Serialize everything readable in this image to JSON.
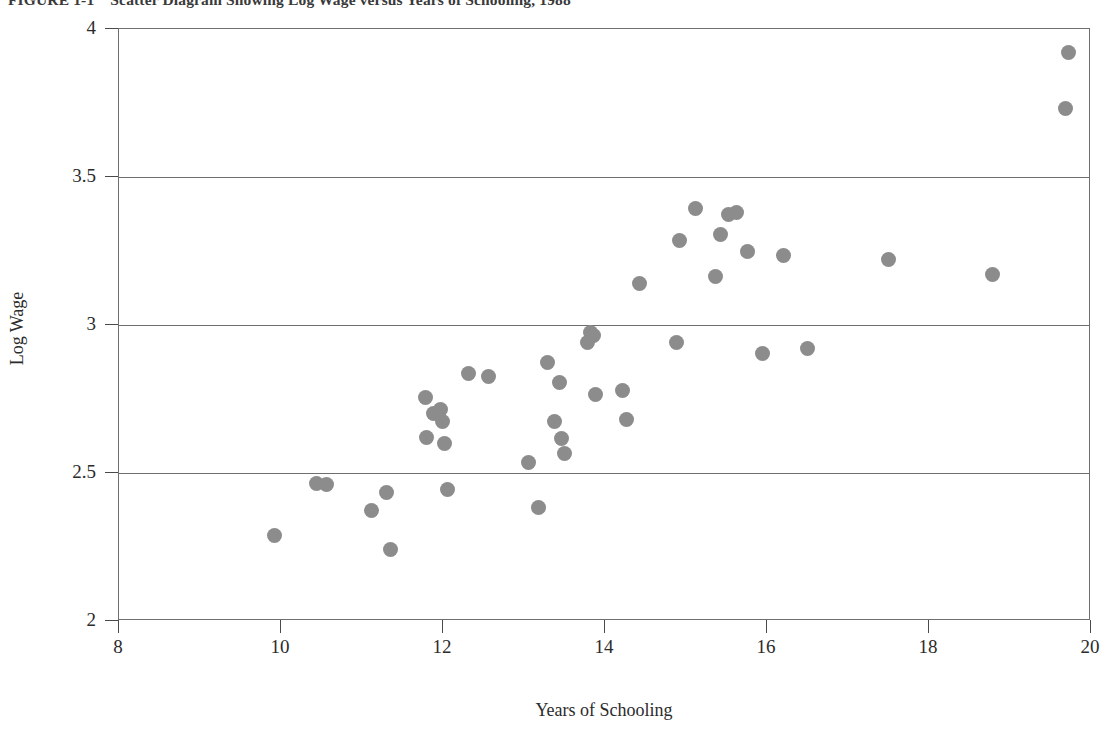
{
  "figure": {
    "caption_number": "FIGURE 1-1",
    "caption_text": "Scatter Diagram Showing Log Wage versus Years of Schooling, 1988"
  },
  "chart_data": {
    "type": "scatter",
    "title": "Scatter Diagram Showing Log Wage versus Years of Schooling, 1988",
    "xlabel": "Years of Schooling",
    "ylabel": "Log Wage",
    "xlim": [
      8,
      20
    ],
    "ylim": [
      2,
      4
    ],
    "xticks": [
      8,
      10,
      12,
      14,
      16,
      18,
      20
    ],
    "xtick_labels": [
      "8",
      "10",
      "12",
      "14",
      "16",
      "18",
      "20"
    ],
    "yticks": [
      2,
      2.5,
      3,
      3.5,
      4
    ],
    "ytick_labels": [
      "2",
      "2.5",
      "3",
      "3.5",
      "4"
    ],
    "grid": "horizontal",
    "legend": null,
    "marker": {
      "shape": "circle",
      "color": "#8c8c8c",
      "size_px": 15
    },
    "points": [
      {
        "x": 9.92,
        "y": 2.29
      },
      {
        "x": 10.44,
        "y": 2.465
      },
      {
        "x": 10.56,
        "y": 2.46
      },
      {
        "x": 11.12,
        "y": 2.375
      },
      {
        "x": 11.3,
        "y": 2.435
      },
      {
        "x": 11.35,
        "y": 2.24
      },
      {
        "x": 11.78,
        "y": 2.755
      },
      {
        "x": 11.8,
        "y": 2.62
      },
      {
        "x": 11.88,
        "y": 2.7
      },
      {
        "x": 11.97,
        "y": 2.715
      },
      {
        "x": 11.99,
        "y": 2.675
      },
      {
        "x": 12.02,
        "y": 2.6
      },
      {
        "x": 12.05,
        "y": 2.445
      },
      {
        "x": 12.32,
        "y": 2.835
      },
      {
        "x": 12.56,
        "y": 2.825
      },
      {
        "x": 13.05,
        "y": 2.535
      },
      {
        "x": 13.18,
        "y": 2.385
      },
      {
        "x": 13.29,
        "y": 2.875
      },
      {
        "x": 13.38,
        "y": 2.675
      },
      {
        "x": 13.44,
        "y": 2.805
      },
      {
        "x": 13.46,
        "y": 2.615
      },
      {
        "x": 13.5,
        "y": 2.565
      },
      {
        "x": 13.78,
        "y": 2.94
      },
      {
        "x": 13.82,
        "y": 2.975
      },
      {
        "x": 13.86,
        "y": 2.965
      },
      {
        "x": 13.88,
        "y": 2.765
      },
      {
        "x": 14.22,
        "y": 2.78
      },
      {
        "x": 14.26,
        "y": 2.68
      },
      {
        "x": 14.42,
        "y": 3.14
      },
      {
        "x": 14.88,
        "y": 2.94
      },
      {
        "x": 14.92,
        "y": 3.285
      },
      {
        "x": 15.12,
        "y": 3.395
      },
      {
        "x": 15.37,
        "y": 3.165
      },
      {
        "x": 15.42,
        "y": 3.305
      },
      {
        "x": 15.52,
        "y": 3.375
      },
      {
        "x": 15.62,
        "y": 3.38
      },
      {
        "x": 15.76,
        "y": 3.25
      },
      {
        "x": 15.94,
        "y": 2.905
      },
      {
        "x": 16.2,
        "y": 3.235
      },
      {
        "x": 16.5,
        "y": 2.92
      },
      {
        "x": 17.5,
        "y": 3.22
      },
      {
        "x": 18.78,
        "y": 3.17
      },
      {
        "x": 19.68,
        "y": 3.73
      },
      {
        "x": 19.72,
        "y": 3.92
      }
    ]
  }
}
